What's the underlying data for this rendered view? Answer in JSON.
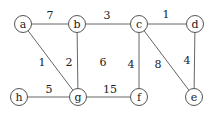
{
  "graph": {
    "nodes": [
      {
        "id": "a",
        "label": "a",
        "x": 23,
        "y": 24
      },
      {
        "id": "b",
        "label": "b",
        "x": 77,
        "y": 24
      },
      {
        "id": "c",
        "label": "c",
        "x": 139,
        "y": 24
      },
      {
        "id": "d",
        "label": "d",
        "x": 195,
        "y": 24
      },
      {
        "id": "h",
        "label": "h",
        "x": 19,
        "y": 97
      },
      {
        "id": "g",
        "label": "g",
        "x": 78,
        "y": 97
      },
      {
        "id": "f",
        "label": "f",
        "x": 139,
        "y": 97
      },
      {
        "id": "e",
        "label": "e",
        "x": 194,
        "y": 97
      }
    ],
    "edges": [
      {
        "from": "a",
        "to": "b",
        "weight": "7",
        "lx": 50,
        "ly": 15
      },
      {
        "from": "b",
        "to": "c",
        "weight": "3",
        "lx": 107,
        "ly": 15
      },
      {
        "from": "c",
        "to": "d",
        "weight": "1",
        "lx": 166,
        "ly": 14
      },
      {
        "from": "a",
        "to": "g",
        "weight": "1",
        "lx": 42,
        "ly": 62
      },
      {
        "from": "b",
        "to": "g",
        "weight": "2",
        "lx": 69,
        "ly": 62
      },
      {
        "from": "c",
        "to": "f",
        "weight": "4",
        "lx": 131,
        "ly": 64
      },
      {
        "from": "c",
        "to": "e",
        "weight": "8",
        "lx": 158,
        "ly": 64
      },
      {
        "from": "d",
        "to": "e",
        "weight": "4",
        "lx": 187,
        "ly": 60
      },
      {
        "from": "h",
        "to": "g",
        "weight": "5",
        "lx": 49,
        "ly": 89
      },
      {
        "from": "g",
        "to": "f",
        "weight": "15",
        "lx": 110,
        "ly": 89
      }
    ],
    "face_labels": [
      {
        "text": "6",
        "x": 103,
        "y": 62
      }
    ]
  }
}
